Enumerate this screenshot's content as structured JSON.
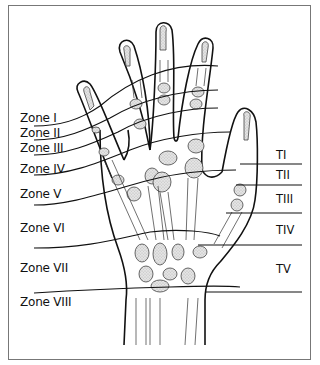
{
  "figure": {
    "type": "hand-extensor-zones-diagram",
    "finger_zones": [
      {
        "id": "zone-1",
        "label": "Zone I"
      },
      {
        "id": "zone-2",
        "label": "Zone II"
      },
      {
        "id": "zone-3",
        "label": "Zone III"
      },
      {
        "id": "zone-4",
        "label": "Zone IV"
      },
      {
        "id": "zone-5",
        "label": "Zone V"
      },
      {
        "id": "zone-6",
        "label": "Zone VI"
      },
      {
        "id": "zone-7",
        "label": "Zone VII"
      },
      {
        "id": "zone-8",
        "label": "Zone VIII"
      }
    ],
    "thumb_zones": [
      {
        "id": "thumb-zone-1",
        "label": "TI"
      },
      {
        "id": "thumb-zone-2",
        "label": "TII"
      },
      {
        "id": "thumb-zone-3",
        "label": "TIII"
      },
      {
        "id": "thumb-zone-4",
        "label": "TIV"
      },
      {
        "id": "thumb-zone-5",
        "label": "TV"
      }
    ],
    "colors": {
      "line": "#111111",
      "bone_fill": "#d6d6d6",
      "frame": "#777777",
      "background": "#ffffff"
    }
  }
}
